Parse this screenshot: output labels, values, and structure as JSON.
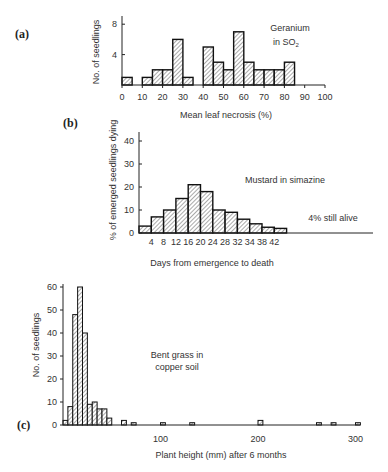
{
  "chart_data": [
    {
      "panel": "(a)",
      "type": "bar",
      "title": "",
      "annotation": [
        "Geranium",
        "in SO2"
      ],
      "xlabel": "Mean leaf necrosis (%)",
      "ylabel": "No. of seedlings",
      "xticks": [
        0,
        10,
        20,
        30,
        40,
        50,
        60,
        70,
        80,
        90,
        100
      ],
      "yticks": [
        4,
        8
      ],
      "xlim": [
        0,
        100
      ],
      "ylim": [
        0,
        9
      ],
      "bin_width": 5,
      "bins": [
        0,
        5,
        10,
        15,
        20,
        25,
        30,
        35,
        40,
        45,
        50,
        55,
        60,
        65,
        70,
        75,
        80
      ],
      "values": [
        1,
        0,
        1,
        2,
        2,
        6,
        1,
        0,
        5,
        3,
        2,
        7,
        3,
        2,
        2,
        2,
        3
      ],
      "grid": false
    },
    {
      "panel": "(b)",
      "type": "bar",
      "title": "",
      "annotation": "Mustard in simazine",
      "note": "4% still alive",
      "xlabel": "Days from emergence to death",
      "ylabel": "% of emerged seedlings dying",
      "xtick_labels": [
        "4",
        "8",
        "12",
        "16",
        "20",
        "24",
        "28",
        "32",
        "34",
        "38",
        "42"
      ],
      "yticks": [
        0,
        10,
        20,
        30,
        40
      ],
      "ylim": [
        0,
        44
      ],
      "categories": [
        "0-4",
        "4-8",
        "8-12",
        "12-16",
        "16-20",
        "20-24",
        "24-28",
        "28-32",
        "32-34",
        "34-38",
        "38-42",
        "42+"
      ],
      "values": [
        3,
        7,
        10,
        15,
        21,
        18,
        10,
        9,
        6,
        4,
        2.5,
        2
      ],
      "grid": false
    },
    {
      "panel": "(c)",
      "type": "bar",
      "title": "",
      "annotation": [
        "Bent grass in",
        "copper soil"
      ],
      "xlabel": "Plant height (mm) after 6 months",
      "ylabel": "No. of seedlings",
      "xticks": [
        100,
        200,
        300
      ],
      "yticks": [
        0,
        10,
        20,
        30,
        40,
        50,
        60
      ],
      "xlim": [
        0,
        310
      ],
      "ylim": [
        0,
        62
      ],
      "bin_width": 5,
      "bins": [
        0,
        5,
        10,
        15,
        20,
        25,
        30,
        35,
        40,
        45,
        60,
        70,
        100,
        130,
        200,
        260,
        275,
        300
      ],
      "values": [
        2,
        8,
        48,
        60,
        40,
        9,
        10,
        7,
        7,
        3,
        2,
        1,
        1,
        1,
        2,
        1,
        1,
        1
      ],
      "grid": false
    }
  ],
  "labels": {
    "a": {
      "panel": "(a)",
      "ylabel": "No. of seedlings",
      "xlabel": "Mean leaf necrosis (%)",
      "ann1": "Geranium",
      "ann2": "in SO",
      "ann2_sub": "2"
    },
    "b": {
      "panel": "(b)",
      "ylabel": "% of emerged seedlings dying",
      "xlabel": "Days from emergence to death",
      "ann": "Mustard in simazine",
      "note": "4% still alive"
    },
    "c": {
      "panel": "(c)",
      "ylabel": "No. of seedlings",
      "xlabel": "Plant height (mm) after 6 months",
      "ann1": "Bent grass in",
      "ann2": "copper soil"
    }
  }
}
